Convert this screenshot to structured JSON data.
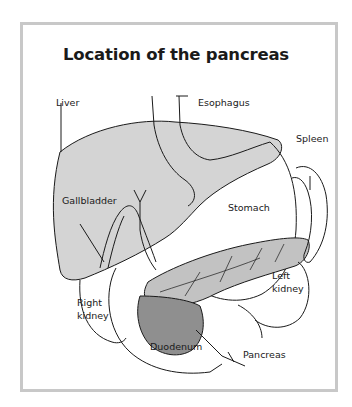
{
  "title": "Location of the pancreas",
  "labels": {
    "liver": "Liver",
    "esophagus": "Esophagus",
    "spleen": "Spleen",
    "gallbladder": "Gallbladder",
    "stomach": "Stomach",
    "left_kidney_1": "Left",
    "left_kidney_2": "kidney",
    "right_kidney_1": "Right",
    "right_kidney_2": "kidney",
    "duodenum": "Duodenum",
    "pancreas": "Pancreas"
  },
  "colors": {
    "frame": "#c8c8c8",
    "liver_fill": "#d4d4d4",
    "pancreas_fill": "#b9b9b9",
    "duodenum_head_fill": "#8f8f8f",
    "stroke": "#1a1a1a"
  }
}
